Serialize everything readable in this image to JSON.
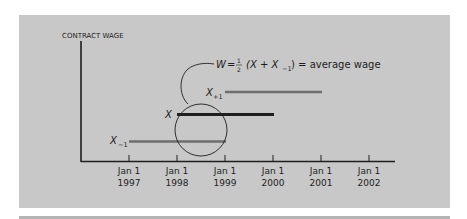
{
  "diagram": {
    "y_axis_label": "CONTRACT WAGE",
    "formula": {
      "lhs": "W",
      "equals": "=",
      "frac_num": "1",
      "frac_den": "2",
      "open": "(X + X",
      "sub": "−1",
      "close": ") = average wage"
    },
    "contracts": [
      {
        "label": "X",
        "sub": "−1",
        "start": "Jan 1 1997",
        "end": "Jan 1 1999",
        "color": "#6e6e6e"
      },
      {
        "label": "X",
        "sub": "",
        "start": "Jan 1 1998",
        "end": "Jan 1 2000",
        "color": "#1e1e1e"
      },
      {
        "label": "X",
        "sub": "+1",
        "start": "Jan 1 1999",
        "end": "Jan 1 2001",
        "color": "#6e6e6e"
      }
    ],
    "x_ticks": [
      {
        "line1": "Jan 1",
        "line2": "1997"
      },
      {
        "line1": "Jan 1",
        "line2": "1998"
      },
      {
        "line1": "Jan 1",
        "line2": "1999"
      },
      {
        "line1": "Jan 1",
        "line2": "2000"
      },
      {
        "line1": "Jan 1",
        "line2": "2001"
      },
      {
        "line1": "Jan 1",
        "line2": "2002"
      }
    ],
    "colors": {
      "panel": "#c8c8c8",
      "axis": "#1e1e1e",
      "current_contract": "#1e1e1e",
      "other_contracts": "#6e6e6e"
    }
  }
}
